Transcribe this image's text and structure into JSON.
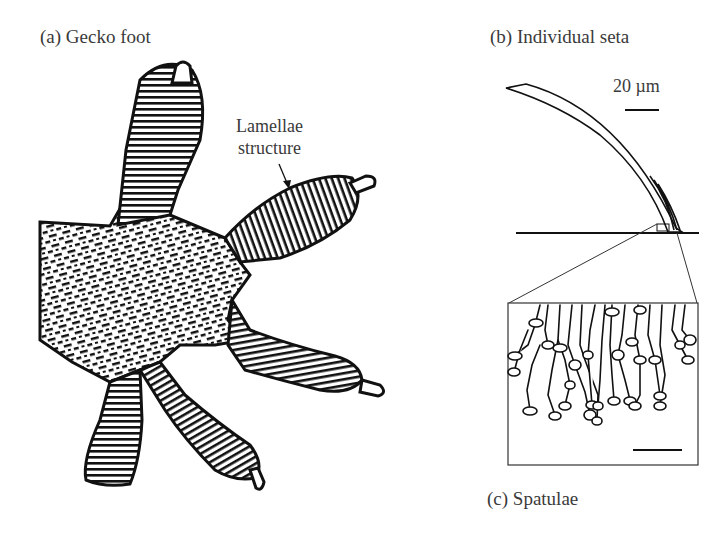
{
  "figure": {
    "panels": [
      {
        "id": "a",
        "title": "(a) Gecko foot"
      },
      {
        "id": "b",
        "title": "(b) Individual seta"
      },
      {
        "id": "c",
        "title": "(c) Spatulae"
      }
    ],
    "annotations": {
      "lamellae_line1": "Lamellae",
      "lamellae_line2": "structure"
    },
    "scale_bars": {
      "seta": "20 µm",
      "spatulae": "1 µm"
    }
  }
}
